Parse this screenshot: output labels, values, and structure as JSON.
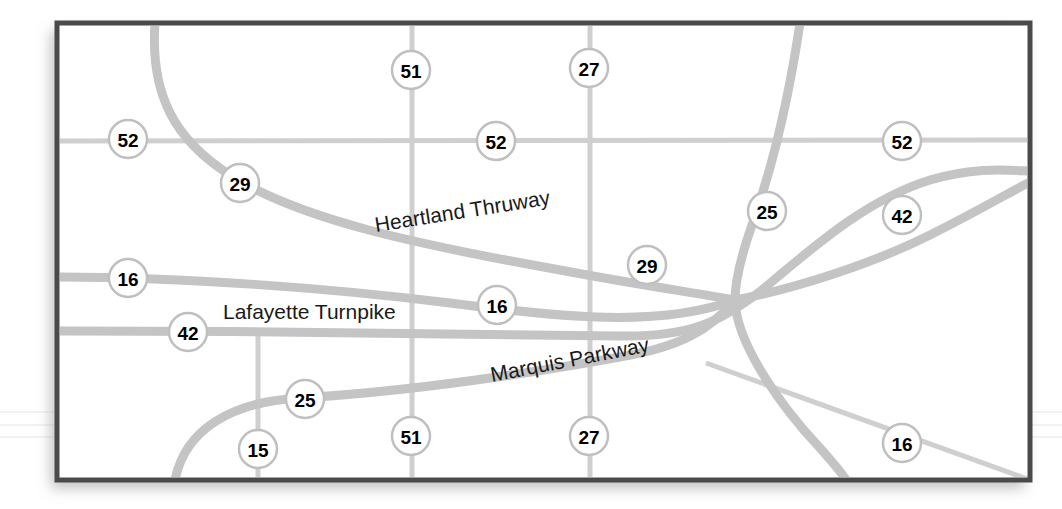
{
  "map": {
    "title": "Highway interchange map",
    "background_color": "#ffffff",
    "road_color": "#c2c2c2",
    "road_color_light": "#cccccc",
    "border_color": "#4a4a4a",
    "shield_fill": "#ffffff",
    "shield_stroke": "#bfbfbf",
    "label_color": "#1a1a1a",
    "frame": {
      "x": 57,
      "y": 23,
      "width": 973,
      "height": 457
    },
    "road_names": [
      {
        "id": "heartland",
        "text": "Heartland   Thruway",
        "x": 376,
        "y": 232,
        "rotate": -9
      },
      {
        "id": "lafayette",
        "text": "Lafayette Turnpike",
        "x": 223,
        "y": 319,
        "rotate": 0
      },
      {
        "id": "marquis",
        "text": "Marquis Parkway",
        "x": 492,
        "y": 382,
        "rotate": -11
      }
    ],
    "shields": [
      {
        "id": "shield-51-top",
        "number": "51",
        "x": 411,
        "y": 70
      },
      {
        "id": "shield-27-top",
        "number": "27",
        "x": 589,
        "y": 68
      },
      {
        "id": "shield-52-left",
        "number": "52",
        "x": 128,
        "y": 139
      },
      {
        "id": "shield-52-mid",
        "number": "52",
        "x": 496,
        "y": 141
      },
      {
        "id": "shield-52-right",
        "number": "52",
        "x": 902,
        "y": 141
      },
      {
        "id": "shield-29-upper",
        "number": "29",
        "x": 240,
        "y": 183
      },
      {
        "id": "shield-25-upper",
        "number": "25",
        "x": 767,
        "y": 211
      },
      {
        "id": "shield-42-right",
        "number": "42",
        "x": 902,
        "y": 215
      },
      {
        "id": "shield-29-mid",
        "number": "29",
        "x": 647,
        "y": 265
      },
      {
        "id": "shield-16-left",
        "number": "16",
        "x": 128,
        "y": 278
      },
      {
        "id": "shield-16-mid",
        "number": "16",
        "x": 497,
        "y": 305
      },
      {
        "id": "shield-42-left",
        "number": "42",
        "x": 188,
        "y": 332
      },
      {
        "id": "shield-25-lower",
        "number": "25",
        "x": 305,
        "y": 399
      },
      {
        "id": "shield-15-bottom",
        "number": "15",
        "x": 258,
        "y": 449
      },
      {
        "id": "shield-51-bottom",
        "number": "51",
        "x": 411,
        "y": 436
      },
      {
        "id": "shield-27-bottom",
        "number": "27",
        "x": 589,
        "y": 436
      },
      {
        "id": "shield-16-right",
        "number": "16",
        "x": 902,
        "y": 443
      }
    ],
    "routes": [
      {
        "id": "route-52",
        "label": "52",
        "kind": "horizontal-thin"
      },
      {
        "id": "route-51",
        "label": "51",
        "kind": "vertical-thin"
      },
      {
        "id": "route-27",
        "label": "27",
        "kind": "vertical-thin"
      },
      {
        "id": "route-15",
        "label": "15",
        "kind": "vertical-thin"
      },
      {
        "id": "route-29",
        "label": "29",
        "kind": "curve"
      },
      {
        "id": "route-16",
        "label": "16",
        "kind": "curve"
      },
      {
        "id": "route-42",
        "label": "42",
        "kind": "curve"
      },
      {
        "id": "route-25",
        "label": "25",
        "kind": "curve"
      }
    ]
  }
}
